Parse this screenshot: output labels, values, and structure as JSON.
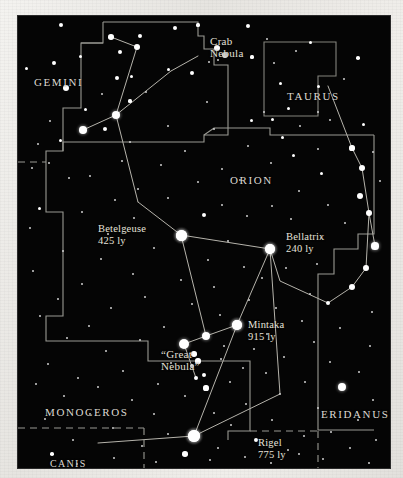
{
  "chart": {
    "sky_color": "#050505",
    "paper_color": "#eceae6",
    "line_color": "#9a9a93",
    "star_color": "#ffffff"
  },
  "constellations": [
    {
      "name": "GEMINI",
      "x": 16,
      "y": 60,
      "size": "normal"
    },
    {
      "name": "TAURUS",
      "x": 269,
      "y": 74,
      "size": "normal"
    },
    {
      "name": "ORION",
      "x": 212,
      "y": 158,
      "size": "normal"
    },
    {
      "name": "MONOCEROS",
      "x": 27,
      "y": 390,
      "size": "normal"
    },
    {
      "name": "ERIDANUS",
      "x": 303,
      "y": 392,
      "size": "normal"
    },
    {
      "name": "LEPUS",
      "x": 157,
      "y": 452,
      "size": "normal"
    },
    {
      "name": "CANIS\nMAJOR",
      "x": 32,
      "y": 442,
      "size": "small"
    }
  ],
  "objects": [
    {
      "name": "Crab\nNebula",
      "x": 192,
      "y": 19
    },
    {
      "name": "“Great\nNebula”",
      "x": 143,
      "y": 332
    }
  ],
  "stars_labeled": [
    {
      "name": "Betelgeuse",
      "distance": "425 ly",
      "x": 80,
      "y": 207,
      "star_x": 163,
      "star_y": 219,
      "r": 5.5
    },
    {
      "name": "Bellatrix",
      "distance": "240 ly",
      "x": 268,
      "y": 215,
      "star_x": 252,
      "star_y": 233,
      "r": 5.2
    },
    {
      "name": "Mintaka",
      "distance": "915 ly",
      "x": 230,
      "y": 303,
      "star_x": 219,
      "star_y": 309,
      "r": 5.0
    },
    {
      "name": "Rigel",
      "distance": "775 ly",
      "x": 240,
      "y": 421,
      "star_x": 176,
      "star_y": 420,
      "r": 6.2
    }
  ],
  "chart_data": {
    "type": "scatter",
    "xlabel": "",
    "ylabel": "",
    "xlim": [
      0,
      372
    ],
    "ylim": [
      0,
      452
    ],
    "grid": false,
    "legend": "none",
    "annotations": [
      "GEMINI",
      "TAURUS",
      "ORION",
      "MONOCEROS",
      "ERIDANUS",
      "LEPUS",
      "CANIS MAJOR",
      "Crab Nebula",
      "“Great Nebula”",
      "Betelgeuse 425 ly",
      "Bellatrix 240 ly",
      "Mintaka 915 ly",
      "Rigel 775 ly"
    ],
    "series": [
      {
        "name": "stars",
        "points": [
          [
            43,
            9,
            2.4
          ],
          [
            93,
            21,
            2.8
          ],
          [
            122,
            20,
            2.2
          ],
          [
            157,
            12,
            2.0
          ],
          [
            180,
            9,
            1.6
          ],
          [
            230,
            10,
            2.1
          ],
          [
            119,
            31,
            3.2
          ],
          [
            249,
            23,
            1.4
          ],
          [
            292,
            26,
            1.5
          ],
          [
            62,
            40,
            1.5
          ],
          [
            207,
            39,
            3.0
          ],
          [
            234,
            41,
            1.6
          ],
          [
            278,
            35,
            1.4
          ],
          [
            340,
            42,
            1.8
          ],
          [
            102,
            36,
            2.4
          ],
          [
            200,
            44,
            1.4
          ],
          [
            150,
            53,
            1.5
          ],
          [
            191,
            46,
            1.4
          ],
          [
            36,
            47,
            1.9
          ],
          [
            256,
            47,
            1.4
          ],
          [
            8,
            52,
            1.5
          ],
          [
            99,
            62,
            2.0
          ],
          [
            113,
            60,
            1.5
          ],
          [
            174,
            57,
            2.4
          ],
          [
            262,
            67,
            1.5
          ],
          [
            48,
            72,
            3.3
          ],
          [
            300,
            70,
            1.5
          ],
          [
            84,
            78,
            1.4
          ],
          [
            128,
            76,
            1.4
          ],
          [
            326,
            63,
            1.4
          ],
          [
            300,
            96,
            1.4
          ],
          [
            189,
            86,
            1.4
          ],
          [
            112,
            85,
            1.6
          ],
          [
            67,
            93,
            1.5
          ],
          [
            98,
            99,
            4.1
          ],
          [
            270,
            92,
            1.5
          ],
          [
            312,
            104,
            1.4
          ],
          [
            233,
            104,
            1.5
          ],
          [
            254,
            103,
            1.5
          ],
          [
            246,
            96,
            1.4
          ],
          [
            32,
            105,
            1.4
          ],
          [
            150,
            110,
            1.4
          ],
          [
            87,
            113,
            2.0
          ],
          [
            196,
            113,
            1.3
          ],
          [
            282,
            110,
            1.3
          ],
          [
            345,
            108,
            1.5
          ],
          [
            65,
            114,
            3.8
          ],
          [
            264,
            121,
            1.5
          ],
          [
            112,
            126,
            1.3
          ],
          [
            230,
            130,
            1.4
          ],
          [
            334,
            132,
            2.6
          ],
          [
            300,
            133,
            1.4
          ],
          [
            20,
            128,
            1.4
          ],
          [
            42,
            124,
            1.5
          ],
          [
            167,
            135,
            1.3
          ],
          [
            275,
            139,
            1.5
          ],
          [
            355,
            136,
            1.3
          ],
          [
            31,
            147,
            1.3
          ],
          [
            104,
            145,
            1.4
          ],
          [
            344,
            152,
            3.0
          ],
          [
            143,
            149,
            1.4
          ],
          [
            253,
            147,
            1.3
          ],
          [
            204,
            153,
            1.4
          ],
          [
            14,
            152,
            1.4
          ],
          [
            303,
            157,
            1.5
          ],
          [
            72,
            160,
            1.4
          ],
          [
            180,
            166,
            1.3
          ],
          [
            222,
            164,
            1.4
          ],
          [
            362,
            165,
            1.3
          ],
          [
            51,
            162,
            1.3
          ],
          [
            120,
            173,
            1.3
          ],
          [
            281,
            175,
            1.4
          ],
          [
            342,
            180,
            3.1
          ],
          [
            97,
            184,
            1.3
          ],
          [
            150,
            182,
            1.4
          ],
          [
            254,
            190,
            1.3
          ],
          [
            204,
            189,
            1.3
          ],
          [
            21,
            192,
            1.5
          ],
          [
            310,
            189,
            1.3
          ],
          [
            351,
            197,
            2.9
          ],
          [
            64,
            196,
            1.4
          ],
          [
            116,
            202,
            1.3
          ],
          [
            186,
            199,
            2.0
          ],
          [
            229,
            200,
            1.3
          ],
          [
            273,
            203,
            1.3
          ],
          [
            327,
            207,
            1.4
          ],
          [
            12,
            212,
            1.3
          ],
          [
            90,
            218,
            1.3
          ],
          [
            163,
            219,
            5.5
          ],
          [
            252,
            233,
            5.2
          ],
          [
            357,
            230,
            3.6
          ],
          [
            303,
            222,
            1.4
          ],
          [
            210,
            225,
            1.3
          ],
          [
            136,
            232,
            1.4
          ],
          [
            45,
            235,
            1.4
          ],
          [
            83,
            243,
            1.3
          ],
          [
            190,
            244,
            1.3
          ],
          [
            348,
            252,
            2.9
          ],
          [
            268,
            252,
            1.4
          ],
          [
            226,
            251,
            1.3
          ],
          [
            299,
            248,
            1.3
          ],
          [
            15,
            255,
            1.4
          ],
          [
            115,
            258,
            1.3
          ],
          [
            163,
            264,
            1.3
          ],
          [
            244,
            262,
            1.3
          ],
          [
            334,
            271,
            3.2
          ],
          [
            64,
            268,
            1.4
          ],
          [
            196,
            271,
            1.3
          ],
          [
            292,
            278,
            1.4
          ],
          [
            127,
            281,
            1.4
          ],
          [
            40,
            283,
            1.3
          ],
          [
            231,
            284,
            1.3
          ],
          [
            174,
            288,
            1.3
          ],
          [
            310,
            287,
            2.0
          ],
          [
            93,
            292,
            1.4
          ],
          [
            258,
            292,
            1.4
          ],
          [
            202,
            299,
            1.3
          ],
          [
            354,
            296,
            1.4
          ],
          [
            22,
            300,
            1.3
          ],
          [
            219,
            309,
            5.0
          ],
          [
            146,
            311,
            1.3
          ],
          [
            284,
            305,
            1.4
          ],
          [
            71,
            310,
            1.3
          ],
          [
            322,
            312,
            1.3
          ],
          [
            249,
            318,
            1.4
          ],
          [
            188,
            320,
            4.4
          ],
          [
            166,
            328,
            5.0
          ],
          [
            206,
            330,
            1.4
          ],
          [
            122,
            324,
            1.3
          ],
          [
            49,
            322,
            1.4
          ],
          [
            296,
            326,
            1.3
          ],
          [
            236,
            333,
            1.3
          ],
          [
            88,
            335,
            1.4
          ],
          [
            352,
            330,
            1.4
          ],
          [
            203,
            343,
            1.3
          ],
          [
            180,
            345,
            2.6
          ],
          [
            153,
            347,
            1.4
          ],
          [
            266,
            341,
            1.4
          ],
          [
            30,
            348,
            1.4
          ],
          [
            312,
            346,
            1.3
          ],
          [
            225,
            352,
            1.3
          ],
          [
            105,
            355,
            1.4
          ],
          [
            186,
            359,
            2.4
          ],
          [
            60,
            362,
            1.3
          ],
          [
            248,
            357,
            1.4
          ],
          [
            341,
            356,
            1.3
          ],
          [
            188,
            372,
            2.6
          ],
          [
            140,
            368,
            1.4
          ],
          [
            287,
            366,
            1.3
          ],
          [
            80,
            371,
            1.4
          ],
          [
            18,
            368,
            1.3
          ],
          [
            212,
            366,
            1.3
          ],
          [
            324,
            371,
            3.9
          ],
          [
            167,
            380,
            1.4
          ],
          [
            262,
            378,
            1.3
          ],
          [
            46,
            380,
            1.4
          ],
          [
            114,
            384,
            1.3
          ],
          [
            355,
            384,
            1.4
          ],
          [
            228,
            388,
            1.3
          ],
          [
            300,
            392,
            1.3
          ],
          [
            196,
            397,
            1.4
          ],
          [
            136,
            398,
            1.3
          ],
          [
            72,
            398,
            1.4
          ],
          [
            27,
            403,
            1.3
          ],
          [
            340,
            404,
            1.4
          ],
          [
            254,
            404,
            1.3
          ],
          [
            176,
            420,
            6.2
          ],
          [
            213,
            409,
            1.4
          ],
          [
            95,
            412,
            1.4
          ],
          [
            313,
            416,
            1.3
          ],
          [
            286,
            420,
            1.4
          ],
          [
            150,
            418,
            1.3
          ],
          [
            238,
            424,
            2.2
          ],
          [
            55,
            424,
            1.3
          ],
          [
            358,
            424,
            1.4
          ],
          [
            124,
            430,
            1.4
          ],
          [
            200,
            432,
            1.3
          ],
          [
            332,
            432,
            1.3
          ],
          [
            270,
            434,
            1.3
          ],
          [
            34,
            438,
            1.8
          ],
          [
            167,
            438,
            2.8
          ],
          [
            96,
            442,
            1.3
          ],
          [
            227,
            441,
            1.3
          ],
          [
            305,
            443,
            1.4
          ],
          [
            138,
            446,
            1.3
          ],
          [
            59,
            448,
            1.3
          ],
          [
            253,
            447,
            1.3
          ],
          [
            351,
            447,
            1.3
          ],
          [
            192,
            444,
            1.3
          ],
          [
            281,
            438,
            1.3
          ]
        ]
      },
      {
        "name": "nebulae",
        "points": [
          [
            199,
            32,
            3.0
          ],
          [
            176,
            338,
            2.8
          ],
          [
            174,
            350,
            2.0
          ],
          [
            178,
            362,
            2.0
          ]
        ]
      }
    ]
  }
}
